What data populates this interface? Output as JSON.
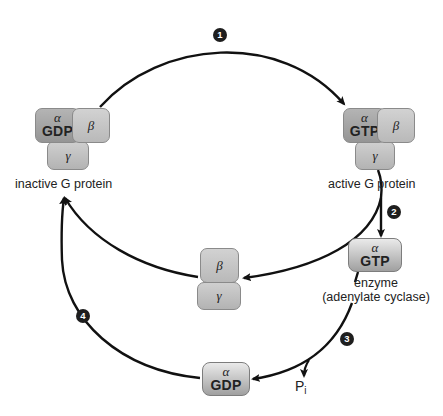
{
  "diagram": {
    "accent_colors": {
      "arrow": "#111111",
      "badge": "#1e1e1e",
      "subunit_dark": "#9e9e9e",
      "subunit_light": "#c6c6c6"
    },
    "steps": [
      "1",
      "2",
      "3",
      "4"
    ],
    "inactive_protein": {
      "alpha": "α",
      "alpha_nucleotide": "GDP",
      "beta": "β",
      "gamma": "γ",
      "label": "inactive G protein"
    },
    "active_protein": {
      "alpha": "α",
      "alpha_nucleotide": "GTP",
      "beta": "β",
      "gamma": "γ",
      "label": "active G protein"
    },
    "beta_gamma_complex": {
      "beta": "β",
      "gamma": "γ"
    },
    "enzyme_complex": {
      "alpha": "α",
      "alpha_nucleotide": "GTP",
      "label_line1": "enzyme",
      "label_line2": "(adenylate cyclase)"
    },
    "alpha_gdp": {
      "alpha": "α",
      "alpha_nucleotide": "GDP"
    },
    "phosphate": {
      "symbol": "P",
      "subscript": "i"
    },
    "edges": [
      {
        "from": "inactive G protein",
        "to": "active G protein",
        "step": "1"
      },
      {
        "from": "active G protein",
        "to": "enzyme",
        "step": "2"
      },
      {
        "from": "active G protein",
        "to": "beta-gamma complex",
        "step": "2"
      },
      {
        "from": "enzyme",
        "to": "alpha-GDP",
        "step": "3"
      },
      {
        "from": "enzyme",
        "to": "Pi",
        "step": "3"
      },
      {
        "from": "alpha-GDP",
        "to": "inactive G protein",
        "step": "4"
      },
      {
        "from": "beta-gamma complex",
        "to": "inactive G protein",
        "step": "4"
      }
    ]
  }
}
